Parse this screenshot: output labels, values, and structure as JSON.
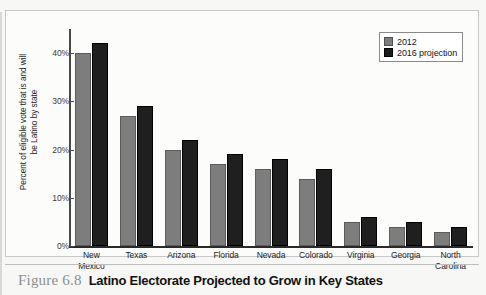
{
  "figure": {
    "number_label": "Figure 6.8",
    "title": "Latino Electorate Projected to Grow in Key States"
  },
  "legend": {
    "position": "top-right",
    "items": [
      {
        "label": "2012",
        "color": "#7d7d7d"
      },
      {
        "label": "2016 projection",
        "color": "#1f1f1f"
      }
    ]
  },
  "axes": {
    "ylabel_line1": "Percent of eligible vote that is and will",
    "ylabel_line2": "be Latino by state",
    "yticks": [
      "0%",
      "10%",
      "20%",
      "30%",
      "40%"
    ]
  },
  "chart_data": {
    "type": "bar",
    "title": "Latino Electorate Projected to Grow in Key States",
    "xlabel": "",
    "ylabel": "Percent of eligible vote that is and will be Latino by state",
    "ylim": [
      0,
      45
    ],
    "ytick_values": [
      0,
      10,
      20,
      30,
      40
    ],
    "ytick_labels": [
      "0%",
      "10%",
      "20%",
      "30%",
      "40%"
    ],
    "grid": false,
    "legend_position": "top-right",
    "categories": [
      "New Mexico",
      "Texas",
      "Arizona",
      "Florida",
      "Nevada",
      "Colorado",
      "Virginia",
      "Georgia",
      "North Carolina"
    ],
    "series": [
      {
        "name": "2012",
        "color": "#7d7d7d",
        "values": [
          40,
          27,
          20,
          17,
          16,
          14,
          5,
          4,
          3
        ]
      },
      {
        "name": "2016 projection",
        "color": "#1f1f1f",
        "values": [
          42,
          29,
          22,
          19,
          18,
          16,
          6,
          5,
          4
        ]
      }
    ]
  }
}
